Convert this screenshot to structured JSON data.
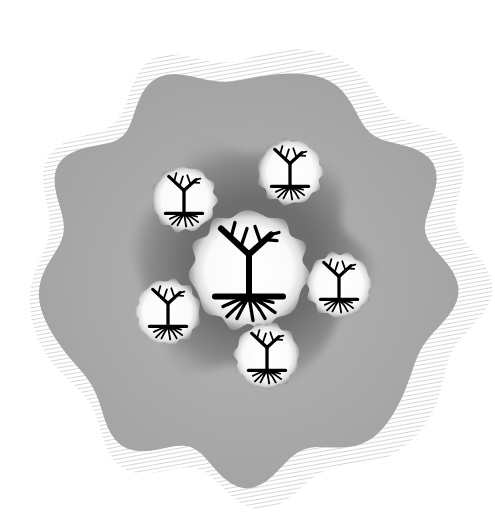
{
  "canvas": {
    "width": 495,
    "height": 524,
    "background": "#ffffff"
  },
  "colors": {
    "hatch": "#c8c8c8",
    "outer_fill": "#a8a8a8",
    "outer_fill_light": "#b4b4b4",
    "inner_blob": "#7c7c7c",
    "inner_blob_light": "#a0a0a0",
    "bubble_center": "#ffffff",
    "bubble_edge": "#b0b0b0",
    "tree": "#000000"
  },
  "outer_hatch": {
    "cx": 250,
    "cy": 272,
    "r": 222,
    "wobble": 12,
    "lobes": 9
  },
  "outer_shape": {
    "cx": 250,
    "cy": 272,
    "r": 200,
    "wobble": 12,
    "lobes": 9
  },
  "inner_blob": {
    "cx": 250,
    "cy": 262,
    "r": 112,
    "wobble": 10,
    "lobes": 6
  },
  "bubbles": [
    {
      "name": "center-tree-bubble",
      "cx": 249,
      "cy": 270,
      "r": 58,
      "scale": 1.0,
      "label": "Central tree"
    },
    {
      "name": "top-left-tree-bubble",
      "cx": 184,
      "cy": 199,
      "r": 32,
      "scale": 0.45,
      "label": "Tree NW"
    },
    {
      "name": "top-right-tree-bubble",
      "cx": 290,
      "cy": 172,
      "r": 32,
      "scale": 0.45,
      "label": "Tree NE"
    },
    {
      "name": "right-tree-bubble",
      "cx": 339,
      "cy": 285,
      "r": 32,
      "scale": 0.45,
      "label": "Tree E"
    },
    {
      "name": "bottom-tree-bubble",
      "cx": 267,
      "cy": 356,
      "r": 32,
      "scale": 0.45,
      "label": "Tree S"
    },
    {
      "name": "left-tree-bubble",
      "cx": 168,
      "cy": 312,
      "r": 32,
      "scale": 0.45,
      "label": "Tree W"
    }
  ]
}
